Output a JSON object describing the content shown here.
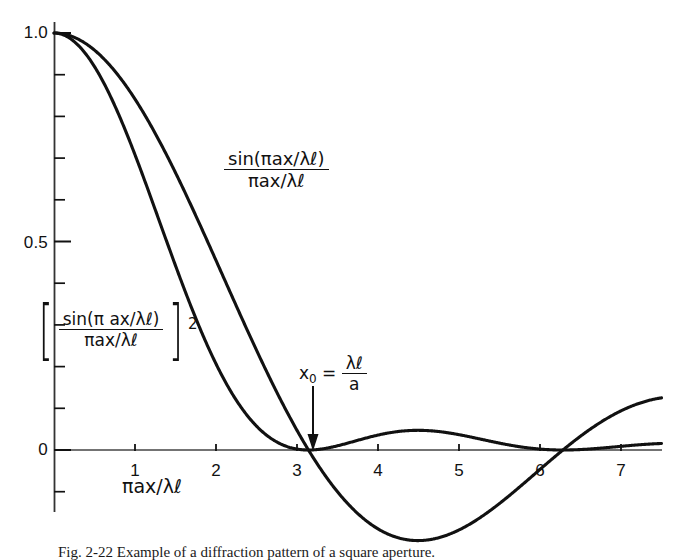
{
  "figure": {
    "background": "#ffffff",
    "ink_color": "#111111",
    "caption": "Fig. 2-22   Example of a diffraction pattern of a square aperture."
  },
  "axes": {
    "x": {
      "label": "πax/λℓ",
      "tick_values": [
        1,
        2,
        3,
        4,
        5,
        6,
        7
      ],
      "tick_labels": [
        "1",
        "2",
        "3",
        "4",
        "5",
        "6",
        "7"
      ],
      "range": [
        0,
        7.5
      ],
      "minor_tick_step": 1,
      "origin_px": 54,
      "px_per_unit": 81
    },
    "y": {
      "tick_values": [
        0,
        0.5,
        1.0
      ],
      "tick_labels": [
        "0",
        "0.5",
        "1.0"
      ],
      "range": [
        -0.3,
        1.0
      ],
      "minor_tick_step": 0.1,
      "origin_px": 450,
      "px_per_unit": 417
    },
    "grid": false
  },
  "labels": {
    "main_curve": {
      "numerator_prefix": "sin",
      "numerator_inner": "πax/λℓ",
      "denominator": "πax/λℓ",
      "plain": "sin(πax/λℓ) / (πax/λℓ)"
    },
    "squared_curve": {
      "numerator_prefix": "sin",
      "numerator_inner": "π ax/λℓ",
      "denominator": "πax/λℓ",
      "exponent": "2",
      "plain": "[sin(πax/λℓ) / (πax/λℓ)]²"
    },
    "annotation_x0": {
      "symbol": "x",
      "subscript": "0",
      "equals": "=",
      "numerator": "λℓ",
      "denominator": "a",
      "plain": "x₀ = λℓ/a"
    }
  },
  "chart_data": {
    "type": "line",
    "title": "",
    "xlabel": "πax/λℓ",
    "ylabel": "",
    "xlim": [
      0,
      7.5
    ],
    "ylim": [
      -0.3,
      1.0
    ],
    "xticks": [
      1,
      2,
      3,
      4,
      5,
      6,
      7
    ],
    "yticks": [
      0,
      0.5,
      1.0
    ],
    "grid": false,
    "legend": "inline-annotations",
    "annotations": [
      {
        "text": "x₀ = λℓ/a",
        "x": 3.1416,
        "y": 0.0,
        "arrow": "down"
      }
    ],
    "series": [
      {
        "name": "sin(πax/λℓ) / (πax/λℓ)",
        "formula": "sinc",
        "x": [
          0,
          0.25,
          0.5,
          0.75,
          1,
          1.25,
          1.5,
          1.75,
          2,
          2.25,
          2.5,
          2.75,
          3,
          3.1416,
          3.25,
          3.5,
          3.75,
          4,
          4.25,
          4.5,
          4.75,
          5,
          5.25,
          5.5,
          5.75,
          6,
          6.2832,
          6.5,
          6.75,
          7,
          7.25
        ],
        "y": [
          1.0,
          0.99,
          0.959,
          0.908,
          0.841,
          0.759,
          0.665,
          0.561,
          0.455,
          0.35,
          0.239,
          0.14,
          0.047,
          0.0,
          -0.033,
          -0.1,
          -0.152,
          -0.189,
          -0.21,
          -0.217,
          -0.21,
          -0.192,
          -0.164,
          -0.129,
          -0.089,
          -0.047,
          0.0,
          0.033,
          0.071,
          0.094,
          0.122
        ]
      },
      {
        "name": "[sin(πax/λℓ) / (πax/λℓ)]²",
        "formula": "sinc_squared",
        "x": [
          0,
          0.25,
          0.5,
          0.75,
          1,
          1.25,
          1.5,
          1.75,
          2,
          2.25,
          2.5,
          2.75,
          3,
          3.1416,
          3.25,
          3.5,
          3.75,
          4,
          4.25,
          4.5,
          4.75,
          5,
          5.25,
          5.5,
          5.75,
          6,
          6.2832,
          6.5,
          6.75,
          7,
          7.25
        ],
        "y": [
          1.0,
          0.98,
          0.92,
          0.824,
          0.708,
          0.576,
          0.442,
          0.315,
          0.207,
          0.122,
          0.057,
          0.02,
          0.002,
          0.0,
          0.001,
          0.01,
          0.023,
          0.036,
          0.044,
          0.047,
          0.044,
          0.037,
          0.027,
          0.017,
          0.008,
          0.002,
          0.0,
          0.001,
          0.005,
          0.009,
          0.015
        ]
      }
    ]
  }
}
